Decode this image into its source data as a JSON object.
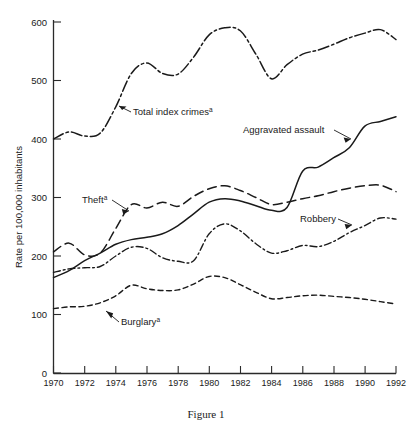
{
  "figure": {
    "caption": "Figure 1"
  },
  "chart_data": {
    "type": "line",
    "title": "",
    "xlabel": "",
    "ylabel": "Rate per 100,000 inhabitants",
    "xlim": [
      1970,
      1992
    ],
    "ylim": [
      0,
      600
    ],
    "grid": false,
    "legend_position": "inline-annotations",
    "x": [
      1970,
      1971,
      1972,
      1973,
      1974,
      1975,
      1976,
      1977,
      1978,
      1979,
      1980,
      1981,
      1982,
      1983,
      1984,
      1985,
      1986,
      1987,
      1988,
      1989,
      1990,
      1991,
      1992
    ],
    "xticks": [
      1970,
      1972,
      1974,
      1976,
      1978,
      1980,
      1982,
      1984,
      1986,
      1988,
      1990,
      1992
    ],
    "yticks": [
      0,
      100,
      200,
      300,
      400,
      500,
      600
    ],
    "series": [
      {
        "name": "Total index crimes",
        "label": "Total index crimes",
        "superscript": "a",
        "linestyle": "dashdot-long",
        "dasharray": "11,3,2.5,3",
        "width": 1.5,
        "values": [
          400,
          412,
          405,
          410,
          455,
          512,
          530,
          512,
          511,
          540,
          578,
          590,
          585,
          545,
          503,
          527,
          545,
          552,
          562,
          573,
          581,
          587,
          570
        ]
      },
      {
        "name": "Aggravated assault",
        "label": "Aggravated assault",
        "superscript": "",
        "linestyle": "solid",
        "dasharray": "none",
        "width": 1.5,
        "values": [
          163,
          175,
          192,
          205,
          220,
          228,
          232,
          238,
          252,
          272,
          292,
          298,
          294,
          286,
          278,
          283,
          345,
          352,
          368,
          385,
          422,
          430,
          438
        ]
      },
      {
        "name": "Theft",
        "label": "Theft",
        "superscript": "a",
        "linestyle": "dashed-long",
        "dasharray": "9,5",
        "width": 1.5,
        "values": [
          207,
          222,
          202,
          205,
          247,
          288,
          282,
          292,
          285,
          302,
          315,
          320,
          312,
          300,
          288,
          292,
          298,
          303,
          310,
          316,
          320,
          321,
          310
        ]
      },
      {
        "name": "Robbery",
        "label": "Robbery",
        "superscript": "",
        "linestyle": "dashdot-short",
        "dasharray": "7,3,1.8,3",
        "width": 1.4,
        "values": [
          172,
          178,
          180,
          182,
          200,
          215,
          213,
          197,
          191,
          192,
          238,
          255,
          243,
          221,
          205,
          209,
          218,
          216,
          225,
          240,
          252,
          265,
          263
        ]
      },
      {
        "name": "Burglary",
        "label": "Burglary",
        "superscript": "a",
        "linestyle": "dashed-short",
        "dasharray": "5,3.5",
        "width": 1.4,
        "values": [
          110,
          113,
          114,
          120,
          132,
          150,
          144,
          141,
          142,
          152,
          165,
          163,
          151,
          138,
          127,
          129,
          132,
          133,
          131,
          129,
          126,
          122,
          118
        ]
      }
    ]
  },
  "annotations": [
    {
      "id": "total-index-crimes",
      "text": "Total index crimes",
      "sup": "a"
    },
    {
      "id": "aggravated-assault",
      "text": "Aggravated assault",
      "sup": ""
    },
    {
      "id": "theft",
      "text": "Theft",
      "sup": "a"
    },
    {
      "id": "robbery",
      "text": "Robbery",
      "sup": ""
    },
    {
      "id": "burglary",
      "text": "Burglary",
      "sup": "a"
    }
  ]
}
